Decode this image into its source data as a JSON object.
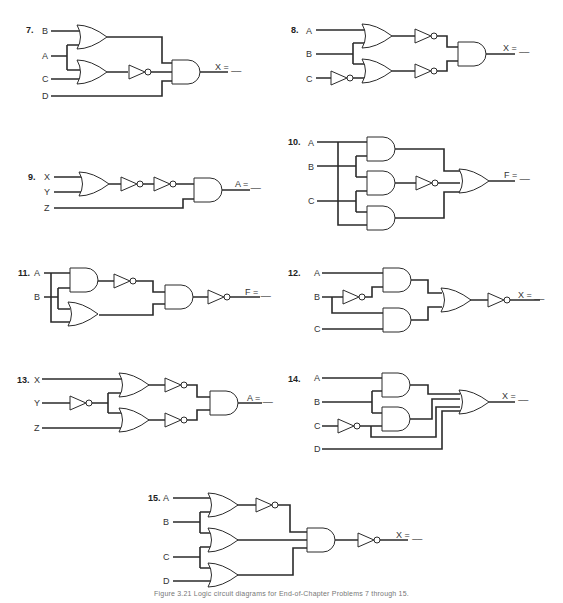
{
  "figure": {
    "caption": "Figure 3.21 Logic circuit diagrams for End-of-Chapter Problems 7 through 15."
  },
  "problems": [
    {
      "number": "7.",
      "inputs": [
        "B",
        "A",
        "C",
        "D"
      ],
      "output": "X = __",
      "gates": [
        "OR",
        "OR",
        "NOT",
        "AND"
      ]
    },
    {
      "number": "8.",
      "inputs": [
        "A",
        "B",
        "C"
      ],
      "output": "X = __",
      "gates": [
        "NOT",
        "OR",
        "OR",
        "NOT",
        "NOT",
        "AND"
      ]
    },
    {
      "number": "9.",
      "inputs": [
        "X",
        "Y",
        "Z"
      ],
      "output": "A = __",
      "gates": [
        "OR",
        "NOT",
        "NOT",
        "AND"
      ]
    },
    {
      "number": "10.",
      "inputs": [
        "A",
        "B",
        "C"
      ],
      "output": "F = __",
      "gates": [
        "AND",
        "AND",
        "AND",
        "NOT",
        "OR"
      ]
    },
    {
      "number": "11.",
      "inputs": [
        "A",
        "B"
      ],
      "output": "F = __",
      "gates": [
        "AND",
        "NOT",
        "OR",
        "AND",
        "NOT"
      ]
    },
    {
      "number": "12.",
      "inputs": [
        "A",
        "B",
        "C"
      ],
      "output": "X = __",
      "gates": [
        "NOT",
        "AND",
        "AND",
        "OR",
        "NOT"
      ]
    },
    {
      "number": "13.",
      "inputs": [
        "X",
        "Y",
        "Z"
      ],
      "output": "A = __",
      "gates": [
        "NOT",
        "OR",
        "OR",
        "NOT",
        "NOT",
        "AND"
      ]
    },
    {
      "number": "14.",
      "inputs": [
        "A",
        "B",
        "C",
        "D"
      ],
      "output": "X = __",
      "gates": [
        "NOT",
        "AND",
        "AND",
        "OR"
      ]
    },
    {
      "number": "15.",
      "inputs": [
        "A",
        "B",
        "C",
        "D"
      ],
      "output": "X = __",
      "gates": [
        "OR",
        "NOT",
        "OR",
        "OR",
        "AND",
        "NOT"
      ]
    }
  ]
}
